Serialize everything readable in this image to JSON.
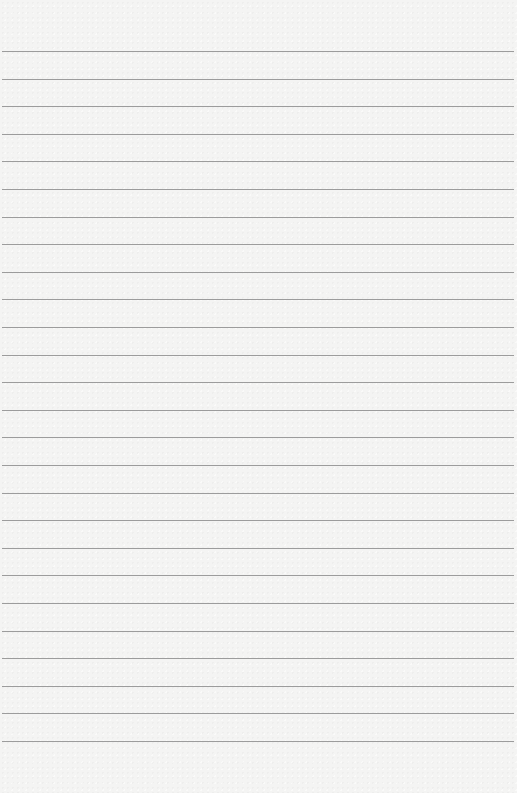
{
  "page": {
    "type": "lined-paper",
    "background_color": "#f4f4f3",
    "line_color": "#9c9c9c",
    "line_count": 26,
    "first_line_y": 51,
    "line_spacing": 27.6,
    "line_left": 2,
    "line_width": 512
  }
}
